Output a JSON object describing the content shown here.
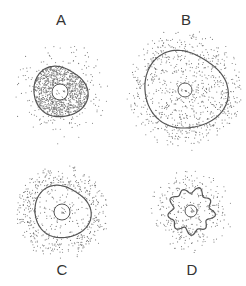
{
  "figure": {
    "panels": [
      {
        "label": "A",
        "cx": 60,
        "cy": 92,
        "r": 26,
        "nucleus_r": 8,
        "inside_density": 0.55,
        "outside_density": 0.035,
        "wavy": false,
        "label_x": 51,
        "label_y": 12
      },
      {
        "label": "B",
        "cx": 185,
        "cy": 90,
        "r": 40,
        "nucleus_r": 7,
        "inside_density": 0.09,
        "outside_density": 0.09,
        "wavy": false,
        "label_x": 176,
        "label_y": 12
      },
      {
        "label": "C",
        "cx": 62,
        "cy": 212,
        "r": 27,
        "nucleus_r": 8,
        "inside_density": 0.05,
        "outside_density": 0.16,
        "wavy": false,
        "label_x": 52,
        "label_y": 262
      },
      {
        "label": "D",
        "cx": 191,
        "cy": 211,
        "r": 21,
        "nucleus_r": 6,
        "inside_density": 0.09,
        "outside_density": 0.09,
        "wavy": true,
        "label_x": 182,
        "label_y": 262
      }
    ],
    "colors": {
      "ink": "#555555",
      "dot": "#777777",
      "background": "#ffffff"
    }
  }
}
